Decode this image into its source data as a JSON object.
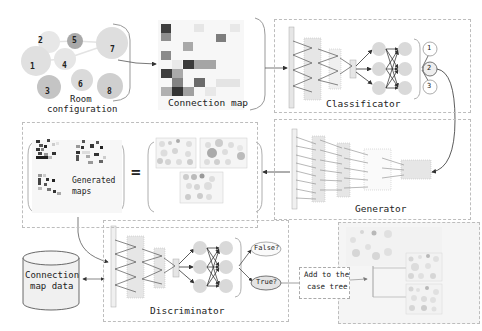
{
  "diagram": {
    "nodes": {
      "room_configuration": {
        "label_line1": "Room",
        "label_line2": "configuration",
        "rooms": [
          "1",
          "2",
          "3",
          "4",
          "5",
          "6",
          "7",
          "8"
        ]
      },
      "connection_map": {
        "label": "Connection map"
      },
      "classificator": {
        "label": "Classificator",
        "outputs": [
          "1",
          "2",
          "3"
        ]
      },
      "generator": {
        "label": "Generator"
      },
      "generated_maps": {
        "label_line1": "Generated",
        "label_line2": "maps",
        "equals": "="
      },
      "connection_map_data": {
        "label_line1": "Connection",
        "label_line2": "map data"
      },
      "discriminator": {
        "label": "Discriminator",
        "outputs": [
          "False?",
          "True?"
        ]
      },
      "add_to_case_tree": {
        "label_line1": "Add to the",
        "label_line2": "case tree"
      },
      "case_tree": {
        "label": ""
      }
    },
    "edges": [
      {
        "from": "room_configuration",
        "to": "connection_map"
      },
      {
        "from": "connection_map",
        "to": "classificator"
      },
      {
        "from": "classificator.output_2",
        "to": "generator"
      },
      {
        "from": "generator",
        "to": "generated_maps"
      },
      {
        "from": "generated_maps",
        "to": "discriminator"
      },
      {
        "from": "connection_map_data",
        "to": "discriminator",
        "bidirectional": true
      },
      {
        "from": "discriminator.true",
        "to": "add_to_case_tree"
      },
      {
        "from": "add_to_case_tree",
        "to": "case_tree"
      }
    ],
    "colors": {
      "panel_border": "#bdbdbd",
      "node_fill": "#d9d9d9",
      "layer_fill": "#e6e6e6",
      "dark_cell": "#3a3a3a",
      "case_tree_bg": "#f2f2f2"
    }
  }
}
